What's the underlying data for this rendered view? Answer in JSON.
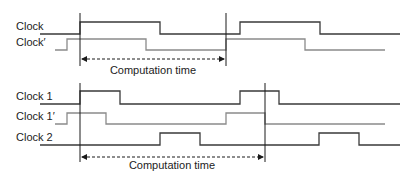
{
  "top_diagram": {
    "signals": [
      {
        "label": "Clock",
        "color": "#3a3a3a"
      },
      {
        "label": "Clock′",
        "color": "#8a8a8a"
      }
    ],
    "interval_label": "Computation time"
  },
  "bottom_diagram": {
    "signals": [
      {
        "label": "Clock 1",
        "color": "#3a3a3a"
      },
      {
        "label": "Clock 1′",
        "color": "#8a8a8a"
      },
      {
        "label": "Clock 2",
        "color": "#3a3a3a"
      }
    ],
    "interval_label": "Computation time"
  }
}
